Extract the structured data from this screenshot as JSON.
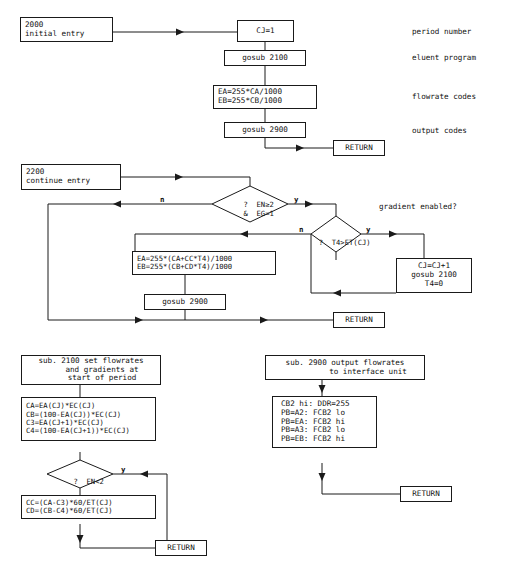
{
  "diagram": {
    "type": "flowchart",
    "stroke_color": "#1a1a1a",
    "background_color": "#ffffff"
  },
  "sections": {
    "initial": {
      "nodes": {
        "entry": {
          "lines": [
            "2000",
            "initial entry"
          ]
        },
        "cj_init": {
          "lines": [
            "CJ=1"
          ]
        },
        "gosub_2100": {
          "lines": [
            "gosub 2100"
          ]
        },
        "ea_eb": {
          "lines": [
            "EA=255*CA/1000",
            "EB=255*CB/1000"
          ]
        },
        "gosub_2900": {
          "lines": [
            "gosub 2900"
          ]
        },
        "return": {
          "lines": [
            "RETURN"
          ]
        }
      },
      "annotations": {
        "period": "period number",
        "eluent": "eluent program",
        "flowrate": "flowrate codes",
        "output": "output codes"
      }
    },
    "continue": {
      "nodes": {
        "entry": {
          "lines": [
            "2200",
            "continue entry"
          ]
        },
        "ea_eb": {
          "lines": [
            "EA=255*(CA+CC*T4)/1000",
            "EB=255*(CB+CD*T4)/1000"
          ]
        },
        "gosub_2900": {
          "lines": [
            "gosub 2900"
          ]
        },
        "cj_incr": {
          "lines": [
            "CJ=CJ+1",
            "gosub 2100",
            "T4=0"
          ]
        },
        "return": {
          "lines": [
            "RETURN"
          ]
        }
      },
      "decisions": {
        "gradient": {
          "lines": [
            "?  EN≥2",
            "&  EG=1"
          ],
          "yes_label": "y",
          "no_label": "n"
        },
        "period_end": {
          "lines": [
            "?  T4>ET(CJ)"
          ],
          "yes_label": "y",
          "no_label": "n"
        }
      },
      "annotations": {
        "gradient": "gradient enabled?"
      }
    },
    "sub2100": {
      "nodes": {
        "header": {
          "lines": [
            "sub. 2100 set flowrates",
            "and gradients at",
            "start of period"
          ]
        },
        "calc": {
          "lines": [
            "CA=EA(CJ)*EC(CJ)",
            "CB=(100-EA(CJ))*EC(CJ)",
            "C3=EA(CJ+1)*EC(CJ)",
            "C4=(100-EA(CJ+1))*EC(CJ)"
          ]
        },
        "gradients": {
          "lines": [
            "CC=(CA-C3)*60/ET(CJ)",
            "CD=(CB-C4)*60/ET(CJ)"
          ]
        },
        "return": {
          "lines": [
            "RETURN"
          ]
        }
      },
      "decisions": {
        "en_lt_2": {
          "lines": [
            "?  EN<2"
          ],
          "yes_label": "y"
        }
      }
    },
    "sub2900": {
      "nodes": {
        "header": {
          "lines": [
            "sub. 2900 output flowrates",
            "to interface unit"
          ]
        },
        "ports": {
          "lines": [
            "CB2 hi: DDR=255",
            "PB=A2: FCB2 lo",
            "PB=EA: FCB2 hi",
            "PB=A3: FCB2 lo",
            "PB=EB: FCB2 hi"
          ]
        },
        "return": {
          "lines": [
            "RETURN"
          ]
        }
      }
    }
  }
}
